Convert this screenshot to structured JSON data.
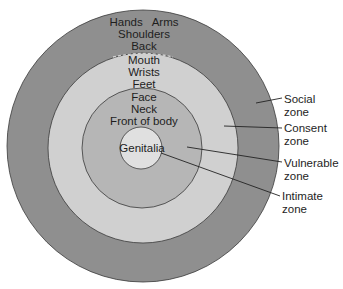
{
  "diagram": {
    "type": "concentric-zones",
    "colors": {
      "social": "#8f8f8f",
      "consent": "#d0d0d0",
      "vulnerable": "#b6b6b6",
      "intimate": "#e0e0e0",
      "outline": "#3a3a3a",
      "leader": "#222222"
    },
    "zones": [
      {
        "id": "social",
        "label_line1": "Social",
        "label_line2": "zone",
        "body_parts": [
          "Hands   Arms",
          "Shoulders",
          "Back"
        ]
      },
      {
        "id": "consent",
        "label_line1": "Consent",
        "label_line2": "zone",
        "body_parts": [
          "Mouth",
          "Wrists",
          "Feet"
        ]
      },
      {
        "id": "vulnerable",
        "label_line1": "Vulnerable",
        "label_line2": "zone",
        "body_parts": [
          "Face",
          "Neck",
          "Front of body"
        ]
      },
      {
        "id": "intimate",
        "label_line1": "Intimate",
        "label_line2": "zone",
        "body_parts": [
          "Genitalia"
        ]
      }
    ]
  }
}
